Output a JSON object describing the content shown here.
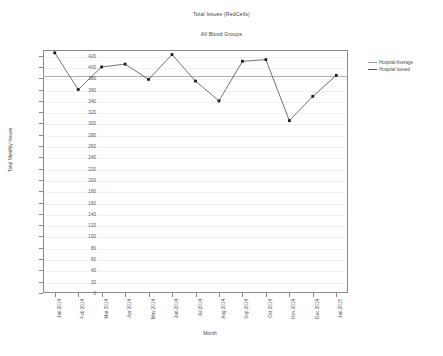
{
  "chart_data": {
    "type": "line",
    "title": "Total Issues (RedCells)",
    "subtitle": "All Blood Groups",
    "xlabel": "Month",
    "ylabel": "Total Monthly Issues",
    "categories": [
      "Jan 2014",
      "Feb 2014",
      "Mar 2014",
      "Apr 2014",
      "May 2014",
      "Jun 2014",
      "Jul 2014",
      "Aug 2014",
      "Sep 2014",
      "Oct 2014",
      "Nov 2014",
      "Dec 2014",
      "Jan 2015"
    ],
    "ylim": [
      0,
      430
    ],
    "yticks": [
      0,
      20,
      40,
      60,
      80,
      100,
      120,
      140,
      160,
      180,
      200,
      220,
      240,
      260,
      280,
      300,
      320,
      340,
      360,
      380,
      400,
      420
    ],
    "grid": true,
    "legend_position": "right",
    "series": [
      {
        "name": "Hospital Average",
        "type": "constant-line",
        "color": "#9a9a9a",
        "value": 383
      },
      {
        "name": "Hospital Issued",
        "type": "line-markers",
        "color": "#4f4f4f",
        "values": [
          425,
          360,
          400,
          405,
          378,
          422,
          375,
          340,
          410,
          413,
          305,
          348,
          385
        ]
      }
    ]
  },
  "legend": {
    "items": [
      {
        "label": "Hospital Average",
        "color": "#9a9a9a"
      },
      {
        "label": "Hospital Issued",
        "color": "#4f4f4f"
      }
    ]
  }
}
